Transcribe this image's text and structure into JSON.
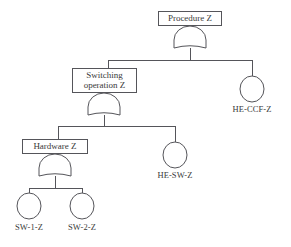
{
  "diagram": {
    "type": "fault-tree",
    "background_color": "#ffffff",
    "line_color": "#55555a",
    "text_color": "#3a3a3a"
  },
  "nodes": {
    "procedure": {
      "id": "procedure-z",
      "label": "Procedure Z",
      "shape": "rectangle",
      "x": 158,
      "y": 11,
      "w": 64,
      "h": 15,
      "font_size": 9
    },
    "switching": {
      "id": "switching-operation-z",
      "label_line1": "Switching",
      "label_line2": "operation Z",
      "shape": "rectangle",
      "x": 72,
      "y": 68,
      "w": 65,
      "h": 25,
      "font_size": 9
    },
    "hardware": {
      "id": "hardware-z",
      "label": "Hardware Z",
      "shape": "rectangle",
      "x": 22,
      "y": 139,
      "w": 66,
      "h": 15,
      "font_size": 9
    }
  },
  "gates": [
    {
      "id": "gate-procedure",
      "type": "or",
      "parent": "procedure-z",
      "cx": 190,
      "top": 26,
      "w": 32,
      "h": 22
    },
    {
      "id": "gate-switching",
      "type": "or",
      "parent": "switching-operation-z",
      "cx": 104,
      "top": 93,
      "w": 32,
      "h": 22
    },
    {
      "id": "gate-hardware",
      "type": "or",
      "parent": "hardware-z",
      "cx": 55,
      "top": 154,
      "w": 32,
      "h": 22
    }
  ],
  "basic_events": [
    {
      "id": "he-ccf-z",
      "label": "HE-CCF-Z",
      "shape": "circle",
      "cx": 252,
      "cy": 89,
      "rx": 12,
      "ry": 13,
      "label_y": 104,
      "font_size": 8.5
    },
    {
      "id": "he-sw-z",
      "label": "HE-SW-Z",
      "shape": "circle",
      "cx": 175,
      "cy": 155,
      "rx": 12,
      "ry": 13,
      "label_y": 170,
      "font_size": 8.5
    },
    {
      "id": "sw-1-z",
      "label": "SW-1-Z",
      "shape": "circle",
      "cx": 29,
      "cy": 206,
      "rx": 12,
      "ry": 13,
      "label_y": 222,
      "font_size": 8.5
    },
    {
      "id": "sw-2-z",
      "label": "SW-2-Z",
      "shape": "circle",
      "cx": 82,
      "cy": 206,
      "rx": 12,
      "ry": 13,
      "label_y": 222,
      "font_size": 8.5
    }
  ],
  "connectors": {
    "bus_top": {
      "y": 60,
      "x_left": 108,
      "x_right": 252
    },
    "bus_mid": {
      "y": 126,
      "x_left": 58,
      "x_right": 175
    },
    "bus_bottom": {
      "y": 188,
      "x_left": 29,
      "x_right": 82
    }
  }
}
